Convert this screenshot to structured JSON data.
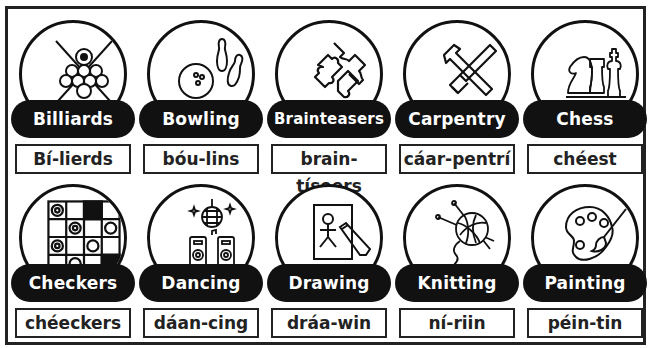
{
  "cards": [
    {
      "label": "Billiards",
      "pronunciation": "Bí-lierds",
      "icon": "billiards-icon"
    },
    {
      "label": "Bowling",
      "pronunciation": "bóu-lins",
      "icon": "bowling-icon"
    },
    {
      "label": "Brainteasers",
      "pronunciation": "brain-tíseers",
      "icon": "puzzle-icon"
    },
    {
      "label": "Carpentry",
      "pronunciation": "cáar-pentrí",
      "icon": "tools-icon"
    },
    {
      "label": "Chess",
      "pronunciation": "chéest",
      "icon": "chess-icon"
    },
    {
      "label": "Checkers",
      "pronunciation": "chéeckers",
      "icon": "checkers-icon"
    },
    {
      "label": "Dancing",
      "pronunciation": "dáan-cing",
      "icon": "disco-icon"
    },
    {
      "label": "Drawing",
      "pronunciation": "dráa-win",
      "icon": "drawing-icon"
    },
    {
      "label": "Knitting",
      "pronunciation": "ní-riin",
      "icon": "yarn-icon"
    },
    {
      "label": "Painting",
      "pronunciation": "péin-tin",
      "icon": "palette-icon"
    }
  ],
  "colors": {
    "ink": "#111111",
    "paper": "#ffffff"
  }
}
